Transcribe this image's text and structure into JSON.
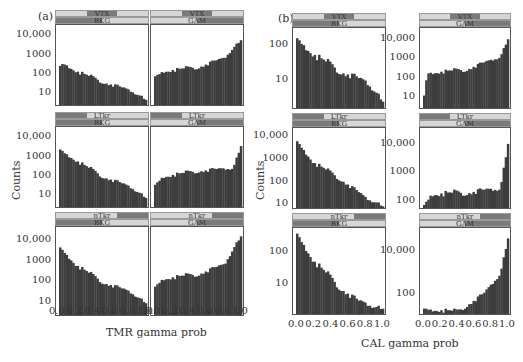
{
  "figure": {
    "panel_a_label": "(a)",
    "panel_b_label": "(b)",
    "y_axis_title": "Counts",
    "a_x_axis_title": "TMR gamma prob",
    "b_x_axis_title": "CAL gamma prob"
  },
  "chart_data": [
    {
      "type": "bar",
      "title": "(a) TMR gamma prob histograms",
      "xlabel": "TMR gamma prob",
      "ylabel": "Counts",
      "yscale": "log",
      "x_ticks": [
        "0.0",
        "0.2",
        "0.4",
        "0.6",
        "0.8",
        "1.0"
      ],
      "y_ticks": [
        "10",
        "100",
        "1000",
        "10,000"
      ],
      "layout": "3 rows x 2 columns",
      "panels": [
        {
          "row_strip": "VTX",
          "col_strip": "BKG",
          "trend": "decreasing",
          "approx_values": {
            "x0.0": 250,
            "x0.05": 400,
            "x0.2": 150,
            "x0.5": 40,
            "x0.8": 15,
            "x1.0": 5
          }
        },
        {
          "row_strip": "VTX",
          "col_strip": "GAM",
          "trend": "increasing",
          "approx_values": {
            "x0.0": 70,
            "x0.1": 150,
            "x0.5": 250,
            "x0.8": 800,
            "x1.0": 10000
          }
        },
        {
          "row_strip": "LTkr",
          "col_strip": "BKG",
          "trend": "decreasing",
          "approx_values": {
            "x0.0": 3000,
            "x0.2": 700,
            "x0.5": 100,
            "x0.8": 30,
            "x1.0": 8
          }
        },
        {
          "row_strip": "LTkr",
          "col_strip": "GAM",
          "trend": "flat then spike",
          "approx_values": {
            "x0.0": 30,
            "x0.1": 100,
            "x0.5": 200,
            "x0.9": 300,
            "x1.0": 8000
          }
        },
        {
          "row_strip": "nTkr",
          "col_strip": "BKG",
          "trend": "decreasing",
          "approx_values": {
            "x0.0": 6000,
            "x0.2": 700,
            "x0.5": 100,
            "x0.8": 35,
            "x1.0": 10
          }
        },
        {
          "row_strip": "nTkr",
          "col_strip": "GAM",
          "trend": "increasing",
          "approx_values": {
            "x0.0": 50,
            "x0.1": 150,
            "x0.5": 250,
            "x0.8": 800,
            "x1.0": 30000
          }
        }
      ]
    },
    {
      "type": "bar",
      "title": "(b) CAL gamma prob histograms",
      "xlabel": "CAL gamma prob",
      "ylabel": "Counts",
      "yscale": "log",
      "x_ticks": [
        "0.0",
        "0.2",
        "0.4",
        "0.6",
        "0.8",
        "1.0"
      ],
      "layout": "3 rows x 2 columns",
      "panels": [
        {
          "row_strip": "VTX",
          "col_strip": "BKG",
          "y_ticks": [
            "10",
            "100"
          ],
          "trend": "decreasing",
          "approx_values": {
            "x0.0": 180,
            "x0.2": 60,
            "x0.5": 20,
            "x0.8": 10,
            "x1.0": 3
          }
        },
        {
          "row_strip": "VTX",
          "col_strip": "GAM",
          "y_ticks": [
            "10",
            "100",
            "1000",
            "10,000"
          ],
          "trend": "increasing",
          "approx_values": {
            "x0.0": 5,
            "x0.05": 200,
            "x0.5": 300,
            "x0.9": 1500,
            "x1.0": 20000
          }
        },
        {
          "row_strip": "LTkr",
          "col_strip": "BKG",
          "y_ticks": [
            "10",
            "100",
            "1000",
            "10,000"
          ],
          "trend": "decreasing",
          "approx_values": {
            "x0.0": 8000,
            "x0.2": 800,
            "x0.5": 150,
            "x0.8": 20,
            "x1.0": 10
          }
        },
        {
          "row_strip": "LTkr",
          "col_strip": "GAM",
          "y_ticks": [
            "100",
            "1000",
            "10,000"
          ],
          "trend": "flat then spike",
          "approx_values": {
            "x0.0": 60,
            "x0.1": 180,
            "x0.5": 200,
            "x0.9": 300,
            "x1.0": 25000
          }
        },
        {
          "row_strip": "nTkr",
          "col_strip": "BKG",
          "y_ticks": [
            "10",
            "100"
          ],
          "trend": "decreasing",
          "approx_values": {
            "x0.0": 500,
            "x0.2": 60,
            "x0.5": 8,
            "x0.7": 3,
            "x0.9": 2
          }
        },
        {
          "row_strip": "nTkr",
          "col_strip": "GAM",
          "y_ticks": [
            "100",
            "10,000"
          ],
          "trend": "increasing",
          "approx_values": {
            "x0.0": 20,
            "x0.4": 15,
            "x0.7": 100,
            "x0.9": 1000,
            "x1.0": 100000
          }
        }
      ]
    }
  ]
}
